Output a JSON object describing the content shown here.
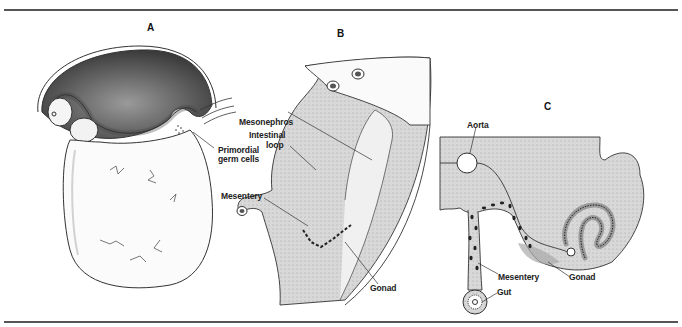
{
  "figure": {
    "panels": [
      {
        "id": "A",
        "label": "A"
      },
      {
        "id": "B",
        "label": "B"
      },
      {
        "id": "C",
        "label": "C"
      }
    ],
    "labels": {
      "primordial_germ_cells_line1": "Primordial",
      "primordial_germ_cells_line2": "germ cells",
      "mesonephros": "Mesonephros",
      "intestinal_loop_line1": "Intestinal",
      "intestinal_loop_line2": "loop",
      "mesentery_b": "Mesentery",
      "gonad_b": "Gonad",
      "aorta": "Aorta",
      "mesentery_c": "Mesentery",
      "gonad_c": "Gonad",
      "gut": "Gut"
    },
    "colors": {
      "line": "#333333",
      "stipple_dark": "#5a5a5a",
      "stipple_light": "#d9d9d9",
      "fill_c": "#cfcfcf"
    }
  }
}
